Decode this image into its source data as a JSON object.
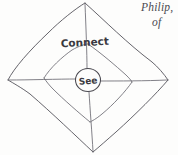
{
  "canvas": {
    "width": 178,
    "height": 155,
    "background_color": "#fdfdfc",
    "ink_color": "#53525a"
  },
  "diagram": {
    "kind": "hand-drawn-sketch",
    "outer_diamond": {
      "name": "outer-diamond",
      "corners": {
        "top": [
          85,
          3
        ],
        "right": [
          168,
          80
        ],
        "bottom": [
          93,
          152
        ],
        "left": [
          8,
          80
        ]
      },
      "style": "sketchy-curved"
    },
    "inner_diamond": {
      "name": "inner-diamond",
      "corners": {
        "top": [
          88,
          44
        ],
        "right": [
          132,
          82
        ],
        "bottom": [
          90,
          122
        ],
        "left": [
          44,
          78
        ]
      },
      "style": "sketchy-curved"
    },
    "center_node": {
      "name": "see-circle",
      "label": "See",
      "center": [
        88,
        80
      ],
      "radius": 12
    },
    "spokes": [
      {
        "name": "spoke-top",
        "to": [
          85,
          3
        ]
      },
      {
        "name": "spoke-right",
        "to": [
          168,
          80
        ]
      },
      {
        "name": "spoke-bottom",
        "to": [
          93,
          152
        ]
      },
      {
        "name": "spoke-left",
        "to": [
          8,
          80
        ]
      }
    ],
    "labels": {
      "connect": "Connect",
      "center": "See"
    }
  },
  "margin_note": {
    "name": "handwritten-margin-note",
    "line_1": "Philip,",
    "line_2": "of",
    "line_3": "",
    "style": "italic-serif-clipped"
  }
}
